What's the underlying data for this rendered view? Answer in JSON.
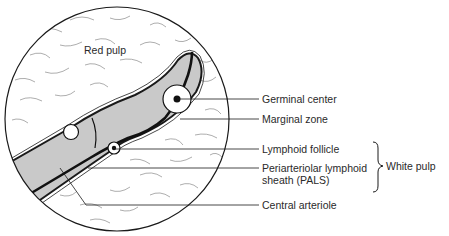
{
  "figure": {
    "colors": {
      "background": "#ffffff",
      "outline": "#1a1a1a",
      "white_pulp_fill": "#c9c9c9",
      "follicle_fill": "#ffffff",
      "texture_stroke": "#8a8a8a"
    }
  },
  "regions": {
    "red_pulp": "Red pulp"
  },
  "callouts": [
    {
      "id": "germinal-center",
      "label": "Germinal center"
    },
    {
      "id": "marginal-zone",
      "label": "Marginal zone"
    },
    {
      "id": "lymphoid-follicle",
      "label": "Lymphoid follicle"
    },
    {
      "id": "pals-line1",
      "label": "Periarteriolar lymphoid"
    },
    {
      "id": "pals-line2",
      "label": "sheath (PALS)"
    },
    {
      "id": "central-arteriole",
      "label": "Central arteriole"
    }
  ],
  "group": {
    "bracket_label": "White pulp",
    "members": [
      "Lymphoid follicle",
      "Periarteriolar lymphoid sheath (PALS)"
    ]
  }
}
